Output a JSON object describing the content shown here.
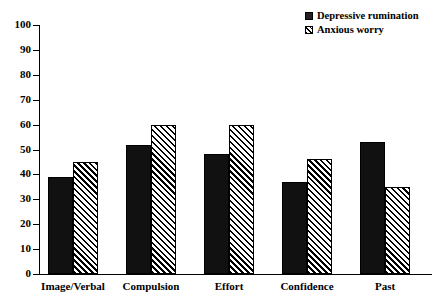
{
  "chart_data": {
    "type": "bar",
    "title": "",
    "xlabel": "",
    "ylabel": "",
    "ylim": [
      0,
      100
    ],
    "yticks": [
      0,
      10,
      20,
      30,
      40,
      50,
      60,
      70,
      80,
      90,
      100
    ],
    "grid": false,
    "legend_position": "top-right",
    "categories": [
      "Image/Verbal",
      "Compulsion",
      "Effort",
      "Confidence",
      "Past"
    ],
    "series": [
      {
        "name": "Depressive rumination",
        "style": "solid-black",
        "color": "#111111",
        "values": [
          39,
          52,
          48,
          37,
          53
        ]
      },
      {
        "name": "Anxious worry",
        "style": "diagonal-hatch",
        "color": "#000000",
        "values": [
          45,
          60,
          60,
          46,
          35
        ]
      }
    ]
  },
  "legend": {
    "items": [
      {
        "label": "Depressive rumination",
        "swatch": "solid-square-icon"
      },
      {
        "label": "Anxious worry",
        "swatch": "hatched-square-icon"
      }
    ]
  }
}
